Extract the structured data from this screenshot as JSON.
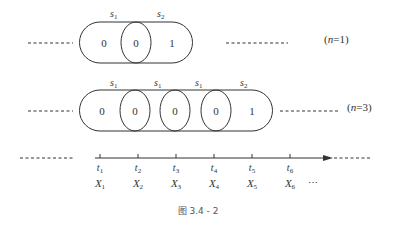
{
  "rows": [
    {
      "id": "n1",
      "note": "(n=1)",
      "n_label": "n",
      "n_value": "=1",
      "segment_labels": [
        {
          "base": "s",
          "sub": "1"
        },
        {
          "base": "s",
          "sub": "2"
        }
      ],
      "cell_values": [
        "0",
        "0",
        "1"
      ]
    },
    {
      "id": "n3",
      "note": "(n=3)",
      "n_label": "n",
      "n_value": "=3",
      "segment_labels": [
        {
          "base": "s",
          "sub": "1"
        },
        {
          "base": "s",
          "sub": "1"
        },
        {
          "base": "s",
          "sub": "1"
        },
        {
          "base": "s",
          "sub": "2"
        }
      ],
      "cell_values": [
        "0",
        "0",
        "0",
        "0",
        "1"
      ]
    }
  ],
  "axis": {
    "times": [
      {
        "base": "t",
        "sub": "1"
      },
      {
        "base": "t",
        "sub": "2"
      },
      {
        "base": "t",
        "sub": "3"
      },
      {
        "base": "t",
        "sub": "4"
      },
      {
        "base": "t",
        "sub": "5"
      },
      {
        "base": "t",
        "sub": "6"
      }
    ],
    "variables": [
      {
        "base": "X",
        "sub": "1"
      },
      {
        "base": "X",
        "sub": "2"
      },
      {
        "base": "X",
        "sub": "3"
      },
      {
        "base": "X",
        "sub": "4"
      },
      {
        "base": "X",
        "sub": "5"
      },
      {
        "base": "X",
        "sub": "6"
      }
    ],
    "ellipsis": "⋯"
  },
  "caption": "图 3.4 - 2"
}
